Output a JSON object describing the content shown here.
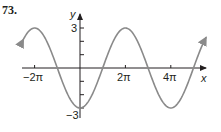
{
  "problem_number": "73.",
  "colors": {
    "curve": "#8a8a8a",
    "axis": "#231f20",
    "text": "#231f20"
  },
  "chart_data": {
    "type": "line",
    "title": "",
    "xlabel": "x",
    "ylabel": "y",
    "x_ticks": [
      {
        "value": -6.2832,
        "label": "−2π"
      },
      {
        "value": 6.2832,
        "label": "2π"
      },
      {
        "value": 12.5664,
        "label": "4π"
      }
    ],
    "y_ticks": [
      {
        "value": 3,
        "label": "3"
      },
      {
        "value": 2,
        "label": ""
      },
      {
        "value": 1,
        "label": ""
      },
      {
        "value": -1,
        "label": ""
      },
      {
        "value": -2,
        "label": ""
      },
      {
        "value": -3,
        "label": "−3"
      }
    ],
    "xlim": [
      -7.9,
      17.4
    ],
    "ylim": [
      -3.5,
      3.5
    ],
    "grid": false,
    "series": [
      {
        "name": "y = -3cos(x/2)",
        "function": "-3*cos(x/2)",
        "amplitude": 3,
        "period": "4π",
        "key_points": [
          {
            "x": "-2π",
            "y": 3
          },
          {
            "x": "-π",
            "y": 0
          },
          {
            "x": "0",
            "y": -3
          },
          {
            "x": "π",
            "y": 0
          },
          {
            "x": "2π",
            "y": 3
          },
          {
            "x": "3π",
            "y": 0
          },
          {
            "x": "4π",
            "y": -3
          },
          {
            "x": "5π",
            "y": 0
          }
        ]
      }
    ]
  },
  "labels": {
    "x_axis": "x",
    "y_axis": "y",
    "x_neg2pi": "−2π",
    "x_2pi": "2π",
    "x_4pi": "4π",
    "y_3": "3",
    "y_neg3": "−3"
  }
}
